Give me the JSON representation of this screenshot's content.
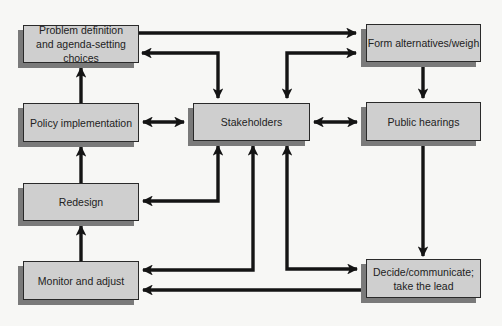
{
  "diagram": {
    "type": "policy-process flow diagram",
    "nodes": {
      "problem_definition": {
        "label": "Problem definition and agenda-setting choices"
      },
      "form_alternatives": {
        "label": "Form alternatives/weigh"
      },
      "policy_implementation": {
        "label": "Policy implementation"
      },
      "stakeholders": {
        "label": "Stakeholders"
      },
      "public_hearings": {
        "label": "Public hearings"
      },
      "redesign": {
        "label": "Redesign"
      },
      "monitor_adjust": {
        "label": "Monitor and adjust"
      },
      "decide_communicate": {
        "label": "Decide/communicate; take the lead"
      }
    },
    "edges": [
      {
        "from": "Problem definition and agenda-setting choices",
        "to": "Form alternatives/weigh",
        "direction": "one-way"
      },
      {
        "from": "Stakeholders",
        "to": "Problem definition and agenda-setting choices",
        "direction": "two-way"
      },
      {
        "from": "Stakeholders",
        "to": "Form alternatives/weigh",
        "direction": "two-way"
      },
      {
        "from": "Form alternatives/weigh",
        "to": "Public hearings",
        "direction": "one-way"
      },
      {
        "from": "Policy implementation",
        "to": "Problem definition and agenda-setting choices",
        "direction": "one-way"
      },
      {
        "from": "Policy implementation",
        "to": "Stakeholders",
        "direction": "two-way"
      },
      {
        "from": "Stakeholders",
        "to": "Public hearings",
        "direction": "two-way"
      },
      {
        "from": "Redesign",
        "to": "Policy implementation",
        "direction": "one-way"
      },
      {
        "from": "Stakeholders",
        "to": "Redesign",
        "direction": "two-way"
      },
      {
        "from": "Public hearings",
        "to": "Decide/communicate; take the lead",
        "direction": "one-way"
      },
      {
        "from": "Monitor and adjust",
        "to": "Redesign",
        "direction": "one-way"
      },
      {
        "from": "Stakeholders",
        "to": "Monitor and adjust",
        "direction": "two-way"
      },
      {
        "from": "Stakeholders",
        "to": "Decide/communicate; take the lead",
        "direction": "two-way"
      },
      {
        "from": "Decide/communicate; take the lead",
        "to": "Monitor and adjust",
        "direction": "one-way"
      }
    ],
    "colors": {
      "box_fill": "#cfcfcf",
      "box_border": "#2a2a2a",
      "box_shadow": "#7a7a7a",
      "arrow": "#141414",
      "background": "#f7f7f5"
    }
  }
}
